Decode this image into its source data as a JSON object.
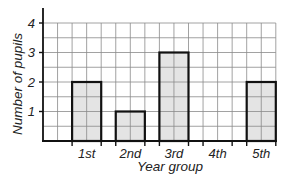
{
  "chart_data": {
    "type": "bar",
    "title": "",
    "xlabel": "Year group",
    "ylabel": "Number of pupils",
    "categories": [
      "1st",
      "2nd",
      "3rd",
      "4th",
      "5th"
    ],
    "values": [
      2,
      1,
      3,
      0,
      2
    ],
    "yticks": [
      "1",
      "2",
      "3",
      "4"
    ],
    "ylim": [
      0,
      4
    ],
    "grid": true,
    "legend": null,
    "colors": {
      "bar_fill": "#e4e4e4",
      "bar_stroke": "#111111",
      "grid": "#8a8a8a",
      "axis": "#111111"
    }
  }
}
